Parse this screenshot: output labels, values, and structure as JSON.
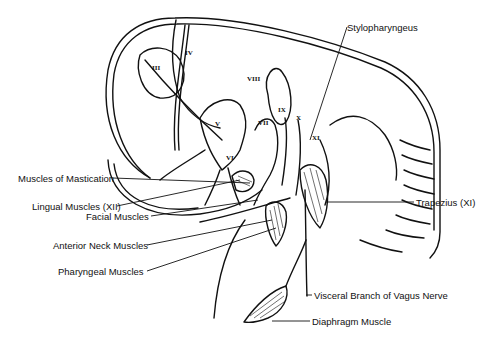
{
  "diagram": {
    "type": "anatomical-line-drawing",
    "nerve_numerals": [
      "III",
      "IV",
      "V",
      "VII",
      "VIII",
      "IX",
      "X",
      "XI",
      "XII"
    ],
    "labels": {
      "stylopharyngeus": "Stylopharyngeus",
      "mastication": "Muscles of Mastication",
      "lingual": "Lingual Muscles (XII)",
      "facial": "Facial Muscles",
      "anterior_neck": "Anterior Neck Muscles",
      "pharyngeal": "Pharyngeal Muscles",
      "trapezius": "Trapezius (XI)",
      "vagus": "Visceral Branch of Vagus Nerve",
      "diaphragm": "Diaphragm Muscle"
    },
    "numerals": {
      "iii": "III",
      "iv": "IV",
      "v": "V",
      "vii": "VII",
      "viii": "VIII",
      "ix": "IX",
      "x": "X",
      "xi": "XI",
      "vi": "VI"
    }
  }
}
